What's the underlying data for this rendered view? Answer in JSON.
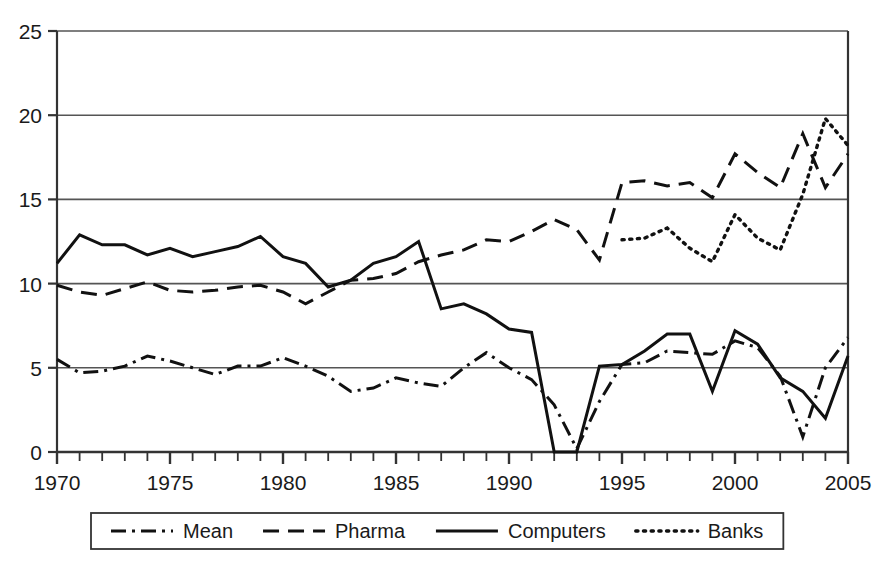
{
  "chart_data": {
    "type": "line",
    "title": "",
    "subtitle": "",
    "xlabel": "",
    "ylabel": "",
    "xlim": [
      1970,
      2005
    ],
    "ylim": [
      0,
      25
    ],
    "ytick_labels": [
      "0",
      "5",
      "10",
      "15",
      "20",
      "25"
    ],
    "yticks": [
      0,
      5,
      10,
      15,
      20,
      25
    ],
    "xtick_labels": [
      "1970",
      "1975",
      "1980",
      "1985",
      "1990",
      "1995",
      "2000",
      "2005"
    ],
    "xticks": [
      1970,
      1975,
      1980,
      1985,
      1990,
      1995,
      2000,
      2005
    ],
    "xtick_minor_step": 1,
    "grid": "horizontal",
    "grid_color": "#555555",
    "legend_position": "bottom-outside",
    "legend_box": true,
    "x": [
      1970,
      1971,
      1972,
      1973,
      1974,
      1975,
      1976,
      1977,
      1978,
      1979,
      1980,
      1981,
      1982,
      1983,
      1984,
      1985,
      1986,
      1987,
      1988,
      1989,
      1990,
      1991,
      1992,
      1993,
      1994,
      1995,
      1996,
      1997,
      1998,
      1999,
      2000,
      2001,
      2002,
      2003,
      2004,
      2005
    ],
    "series": [
      {
        "name": "Mean",
        "dash": "dash-dot",
        "color": "#111111",
        "x": [
          1970,
          1971,
          1972,
          1973,
          1974,
          1975,
          1976,
          1977,
          1978,
          1979,
          1980,
          1981,
          1982,
          1983,
          1984,
          1985,
          1986,
          1987,
          1988,
          1989,
          1990,
          1991,
          1992,
          1993,
          1994,
          1995,
          1996,
          1997,
          1998,
          1999,
          2000,
          2001,
          2002,
          2003,
          2004,
          2005
        ],
        "values": [
          5.5,
          4.7,
          4.8,
          5.1,
          5.7,
          5.4,
          5.0,
          4.6,
          5.1,
          5.1,
          5.6,
          5.1,
          4.5,
          3.6,
          3.8,
          4.4,
          4.1,
          3.9,
          5.0,
          5.9,
          5.0,
          4.3,
          2.8,
          0.2,
          3.0,
          5.2,
          5.3,
          6.0,
          5.9,
          5.8,
          6.6,
          6.2,
          4.5,
          0.9,
          5.0,
          6.8
        ]
      },
      {
        "name": "Pharma",
        "dash": "dashed",
        "color": "#111111",
        "x": [
          1970,
          1971,
          1972,
          1973,
          1974,
          1975,
          1976,
          1977,
          1978,
          1979,
          1980,
          1981,
          1982,
          1983,
          1984,
          1985,
          1986,
          1987,
          1988,
          1989,
          1990,
          1991,
          1992,
          1993,
          1994,
          1995,
          1996,
          1997,
          1998,
          1999,
          2000,
          2001,
          2002,
          2003,
          2004,
          2005
        ],
        "values": [
          9.9,
          9.5,
          9.3,
          9.7,
          10.1,
          9.6,
          9.5,
          9.6,
          9.8,
          9.9,
          9.5,
          8.8,
          9.5,
          10.2,
          10.3,
          10.6,
          11.3,
          11.7,
          12.0,
          12.6,
          12.5,
          13.1,
          13.8,
          13.2,
          11.4,
          16.0,
          16.1,
          15.8,
          16.0,
          15.1,
          17.7,
          16.6,
          15.7,
          18.9,
          15.7,
          17.7
        ]
      },
      {
        "name": "Computers",
        "dash": "solid",
        "color": "#111111",
        "x": [
          1970,
          1971,
          1972,
          1973,
          1974,
          1975,
          1976,
          1977,
          1978,
          1979,
          1980,
          1981,
          1982,
          1983,
          1984,
          1985,
          1986,
          1987,
          1988,
          1989,
          1990,
          1991,
          1992,
          1993,
          1994,
          1995,
          1996,
          1997,
          1998,
          1999,
          2000,
          2001,
          2002,
          2003,
          2004,
          2005
        ],
        "values": [
          11.2,
          12.9,
          12.3,
          12.3,
          11.7,
          12.1,
          11.6,
          11.9,
          12.2,
          12.8,
          11.6,
          11.2,
          9.8,
          10.2,
          11.2,
          11.6,
          12.5,
          8.5,
          8.8,
          8.2,
          7.3,
          7.1,
          0.0,
          0.0,
          5.1,
          5.2,
          6.0,
          7.0,
          7.0,
          3.6,
          7.2,
          6.4,
          4.4,
          3.6,
          2.0,
          5.7
        ]
      },
      {
        "name": "Banks",
        "dash": "dotted",
        "color": "#111111",
        "x": [
          1995,
          1996,
          1997,
          1998,
          1999,
          2000,
          2001,
          2002,
          2003,
          2004,
          2005
        ],
        "values": [
          12.6,
          12.7,
          13.3,
          12.1,
          11.3,
          14.1,
          12.7,
          12.0,
          15.3,
          19.8,
          18.2
        ]
      }
    ]
  },
  "legend": {
    "items": [
      {
        "label": "Mean",
        "dash": "dash-dot"
      },
      {
        "label": "Pharma",
        "dash": "dashed"
      },
      {
        "label": "Computers",
        "dash": "solid"
      },
      {
        "label": "Banks",
        "dash": "dotted"
      }
    ]
  },
  "axes": {
    "y_labels": [
      "25",
      "20",
      "15",
      "10",
      "5",
      "0"
    ],
    "x_labels": [
      "1970",
      "1975",
      "1980",
      "1985",
      "1990",
      "1995",
      "2000",
      "2005"
    ]
  }
}
